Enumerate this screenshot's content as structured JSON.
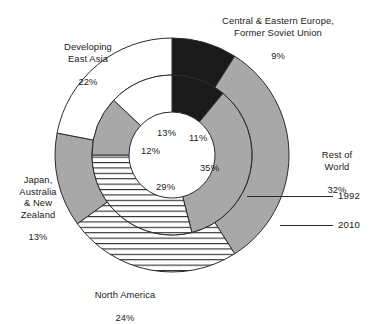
{
  "chart_data": {
    "type": "pie",
    "title": "",
    "subtitle": "",
    "xlabel": "",
    "ylabel": "",
    "legend_position": "callout-right",
    "grid": false,
    "variant": "concentric-double-donut",
    "categories": [
      "Central & Eastern Europe, Former Soviet Union",
      "Rest of World",
      "North America",
      "Japan, Australia & New Zealand",
      "Developing East Asia"
    ],
    "series": [
      {
        "name": "1992",
        "ring": "inner",
        "values": [
          11,
          35,
          29,
          12,
          13
        ]
      },
      {
        "name": "2010",
        "ring": "outer",
        "values": [
          9,
          32,
          24,
          13,
          22
        ]
      }
    ],
    "slice_styles": [
      "black",
      "gray",
      "hatch-horizontal",
      "gray",
      "white"
    ],
    "colors": {
      "black": "#1a1a1a",
      "gray": "#a8a8a8",
      "white": "#ffffff",
      "outline": "#2b2b2b",
      "hatch_line": "#2b2b2b",
      "text": "#1a1a1a",
      "background": "#ffffff"
    }
  },
  "labels": {
    "ceefsu": {
      "name": "Central & Eastern Europe,\nFormer Soviet Union",
      "value": "9%"
    },
    "rest_of_world": {
      "name": "Rest of\nWorld",
      "value": "32%"
    },
    "north_america": {
      "name": "North America",
      "value": "24%"
    },
    "japan_anz": {
      "name": "Japan,\nAustralia\n& New\nZealand",
      "value": "13%"
    },
    "developing_east_asia": {
      "name": "Developing\nEast Asia",
      "value": "22%"
    }
  },
  "inner_values": {
    "ceefsu": "11%",
    "rest_of_world": "35%",
    "north_america": "29%",
    "japan_anz": "12%",
    "developing_east_asia": "13%"
  },
  "callouts": {
    "inner_year": "1992",
    "outer_year": "2010"
  }
}
